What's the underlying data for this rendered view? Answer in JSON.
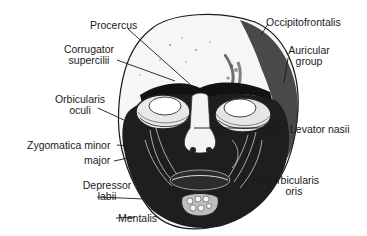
{
  "figure": {
    "colors": {
      "ink": "#1a1a1a",
      "background": "#ffffff",
      "shade": "#2a2a2a",
      "light": "#dcdcdc"
    }
  },
  "labels": {
    "procercus": "Procercus",
    "corrugator_1": "Corrugator",
    "corrugator_2": "supercilii",
    "orbicularis_oculi_1": "Orbicularis",
    "orbicularis_oculi_2": "oculi",
    "zygomatica_minor": "Zygomatica minor",
    "major": "major",
    "depressor_1": "Depressor",
    "depressor_2": "labii",
    "mentalis": "Mentalis",
    "occipitofrontalis": "Occipitofrontalis",
    "auricular_1": "Auricular",
    "auricular_2": "group",
    "levator_nasii": "Levator nasii",
    "orbicularis_oris_1": "Orbicularis",
    "orbicularis_oris_2": "oris"
  }
}
